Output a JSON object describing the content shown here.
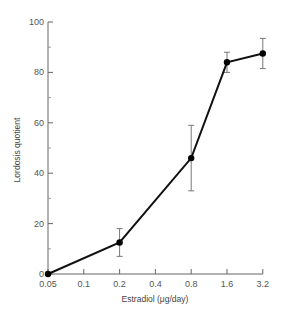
{
  "chart_data": {
    "type": "line",
    "title": "",
    "xlabel": "Estradiol (μg/day)",
    "ylabel": "Lordosis quotient",
    "x_scale": "log2-categorical",
    "x_ticks": [
      "0.05",
      "0.1",
      "0.2",
      "0.4",
      "0.8",
      "1.6",
      "3.2"
    ],
    "y_ticks": [
      "0",
      "20",
      "40",
      "60",
      "80",
      "100"
    ],
    "y_minor_ticks": [
      10,
      30,
      50,
      70,
      90
    ],
    "ylim": [
      0,
      100
    ],
    "grid": false,
    "legend": null,
    "series": [
      {
        "name": "Lordosis quotient",
        "x": [
          "0.05",
          "0.2",
          "0.8",
          "1.6",
          "3.2"
        ],
        "values": [
          0,
          12.5,
          46,
          84,
          87.5
        ],
        "error": [
          0,
          5.5,
          13,
          4,
          6
        ]
      }
    ]
  }
}
